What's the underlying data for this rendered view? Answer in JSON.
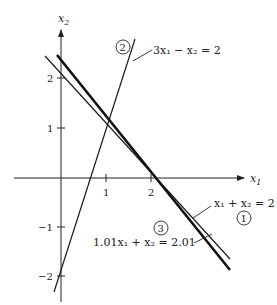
{
  "diagram": {
    "axes": {
      "x_label": "x",
      "x_sub": "1",
      "y_label": "x",
      "y_sub": "2",
      "x_ticks": [
        {
          "value": 1,
          "label": "1"
        },
        {
          "value": 2,
          "label": "2"
        }
      ],
      "y_ticks": [
        {
          "value": 2,
          "label": "2"
        },
        {
          "value": 1,
          "label": "1"
        },
        {
          "value": -1,
          "label": "−1"
        },
        {
          "value": -2,
          "label": "−2"
        }
      ]
    },
    "lines": [
      {
        "id": "1",
        "marker": "1",
        "equation": "x₁ + x₂ = 2",
        "weight": "thin"
      },
      {
        "id": "2",
        "marker": "2",
        "equation": "3x₁ − x₂ = 2",
        "weight": "thin"
      },
      {
        "id": "3",
        "marker": "3",
        "equation": "1.01x₁ + x₂ = 2.01",
        "weight": "thick"
      }
    ]
  }
}
